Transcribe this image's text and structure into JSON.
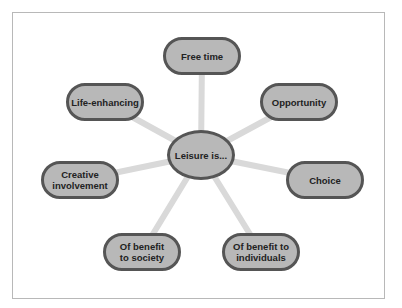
{
  "diagram": {
    "center": {
      "label": "Leisure is..."
    },
    "nodes": [
      {
        "id": "free-time",
        "label": "Free time",
        "x": 163,
        "y": 37
      },
      {
        "id": "life-enhancing",
        "label": "Life-enhancing",
        "x": 66,
        "y": 83
      },
      {
        "id": "opportunity",
        "label": "Opportunity",
        "x": 260,
        "y": 83
      },
      {
        "id": "creative-involvement",
        "label": "Creative involvement",
        "x": 41,
        "y": 161
      },
      {
        "id": "choice",
        "label": "Choice",
        "x": 286,
        "y": 161
      },
      {
        "id": "of-benefit-to-society",
        "label": "Of benefit to society",
        "x": 103,
        "y": 233
      },
      {
        "id": "of-benefit-to-individuals",
        "label": "Of benefit to individuals",
        "x": 222,
        "y": 233
      }
    ],
    "colors": {
      "node_fill": "#b8b8b8",
      "node_border": "#555555",
      "connector": "#d9d9d9",
      "frame": "#b8b8b8"
    }
  }
}
